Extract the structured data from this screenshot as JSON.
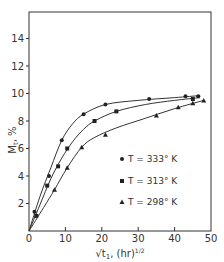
{
  "chart_data": {
    "type": "line",
    "title": "",
    "xlabel": "√t, (hr)^1/2",
    "ylabel": "M_t, %",
    "xlim": [
      0,
      50
    ],
    "ylim": [
      0,
      16
    ],
    "xticks": [
      0,
      10,
      20,
      30,
      40,
      50
    ],
    "yticks": [
      2,
      4,
      6,
      8,
      10,
      12,
      14
    ],
    "grid": false,
    "legend_position": "center-right",
    "series": [
      {
        "name": "T = 333° K",
        "marker": "circle",
        "x": [
          1.5,
          5.5,
          9,
          15,
          21,
          33,
          43,
          46.5
        ],
        "y": [
          1.4,
          4.0,
          6.6,
          8.5,
          9.2,
          9.6,
          9.8,
          9.8
        ],
        "curve": [
          [
            0,
            0
          ],
          [
            3,
            2.5
          ],
          [
            6,
            4.6
          ],
          [
            9,
            6.6
          ],
          [
            12,
            7.8
          ],
          [
            15,
            8.5
          ],
          [
            21,
            9.2
          ],
          [
            30,
            9.5
          ],
          [
            40,
            9.7
          ],
          [
            47,
            9.85
          ]
        ]
      },
      {
        "name": "T = 313° K",
        "marker": "square",
        "x": [
          2,
          5,
          8,
          10.5,
          18,
          24,
          45
        ],
        "y": [
          1.1,
          3.3,
          4.7,
          6.0,
          8.0,
          8.7,
          9.6
        ],
        "curve": [
          [
            0,
            0
          ],
          [
            3,
            1.9
          ],
          [
            6,
            3.8
          ],
          [
            9,
            5.3
          ],
          [
            12,
            6.5
          ],
          [
            15,
            7.4
          ],
          [
            18,
            8.0
          ],
          [
            24,
            8.7
          ],
          [
            32,
            9.2
          ],
          [
            40,
            9.5
          ],
          [
            47,
            9.7
          ]
        ]
      },
      {
        "name": "T = 298° K",
        "marker": "triangle",
        "x": [
          7,
          10.5,
          14.5,
          21,
          35,
          41,
          45,
          48
        ],
        "y": [
          3.0,
          4.6,
          6.1,
          7.0,
          8.4,
          9.0,
          9.3,
          9.5
        ],
        "curve": [
          [
            0,
            0
          ],
          [
            4,
            1.7
          ],
          [
            7,
            3.0
          ],
          [
            10.5,
            4.6
          ],
          [
            14.5,
            6.1
          ],
          [
            18,
            6.8
          ],
          [
            24,
            7.5
          ],
          [
            32,
            8.2
          ],
          [
            40,
            8.9
          ],
          [
            48,
            9.5
          ]
        ]
      }
    ]
  },
  "axes": {
    "x_label_main": "√t",
    "x_label_sub": "1",
    "x_label_units": ", (hr)",
    "x_label_exp": "1/2",
    "y_label_main": "M",
    "y_label_sub": "t",
    "y_label_units": ", %"
  },
  "legend": [
    {
      "label": "T = 333° K"
    },
    {
      "label": "T = 313° K"
    },
    {
      "label": "T = 298° K"
    }
  ]
}
